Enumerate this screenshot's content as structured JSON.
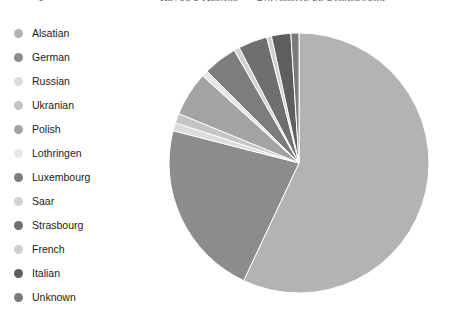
{
  "header": {
    "page_number": "1",
    "title": "Revue d'Alsace — Université de Strasbourg"
  },
  "legend": {
    "position": "left",
    "items": [
      {
        "label": "Alsatian",
        "color": "#b3b3b3"
      },
      {
        "label": "German",
        "color": "#8c8c8c"
      },
      {
        "label": "Russian",
        "color": "#dcdcdc"
      },
      {
        "label": "Ukranian",
        "color": "#c4c4c4"
      },
      {
        "label": "Polish",
        "color": "#a3a3a3"
      },
      {
        "label": "Lothringen",
        "color": "#e8e8e8"
      },
      {
        "label": "Luxembourg",
        "color": "#7d7d7d"
      },
      {
        "label": "Saar",
        "color": "#d2d2d2"
      },
      {
        "label": "Strasbourg",
        "color": "#6f6f6f"
      },
      {
        "label": "French",
        "color": "#cfcfcf"
      },
      {
        "label": "Italian",
        "color": "#5e5e5e"
      },
      {
        "label": "Unknown",
        "color": "#7a7a7a"
      }
    ]
  },
  "chart_data": {
    "type": "pie",
    "title": "",
    "xlabel": "",
    "ylabel": "",
    "legend_position": "left",
    "grid": false,
    "start_angle_deg": 0,
    "direction": "clockwise",
    "labels": [
      "Alsatian",
      "German",
      "Russian",
      "Ukranian",
      "Polish",
      "Lothringen",
      "Luxembourg",
      "Saar",
      "Strasbourg",
      "French",
      "Italian",
      "Unknown"
    ],
    "values": [
      57.0,
      22.0,
      1.0,
      1.2,
      5.5,
      0.8,
      4.2,
      0.7,
      3.6,
      0.6,
      2.4,
      1.0
    ],
    "colors": [
      "#b3b3b3",
      "#8c8c8c",
      "#dcdcdc",
      "#c4c4c4",
      "#a3a3a3",
      "#e8e8e8",
      "#7d7d7d",
      "#d2d2d2",
      "#6f6f6f",
      "#cfcfcf",
      "#5e5e5e",
      "#7a7a7a"
    ],
    "units": "percent"
  }
}
